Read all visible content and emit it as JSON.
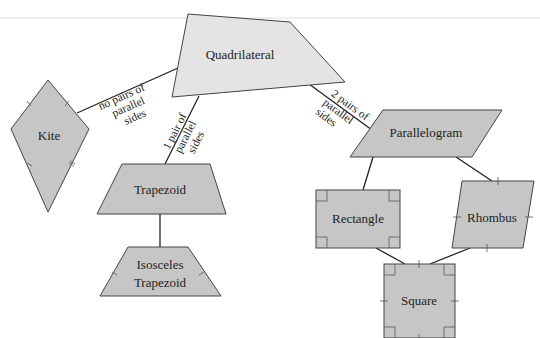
{
  "diagram": {
    "type": "hierarchy",
    "colors": {
      "light_fill": "#e4e4e4",
      "dark_fill": "#c6c6c6",
      "stroke": "#333333",
      "text": "#222222"
    },
    "nodes": {
      "quadrilateral": {
        "label": "Quadrilateral"
      },
      "kite": {
        "label": "Kite"
      },
      "trapezoid": {
        "label": "Trapezoid"
      },
      "isosceles_line1": {
        "label": "Isosceles"
      },
      "isosceles_line2": {
        "label": "Trapezoid"
      },
      "parallelogram": {
        "label": "Parallelogram"
      },
      "rectangle": {
        "label": "Rectangle"
      },
      "rhombus": {
        "label": "Rhombus"
      },
      "square": {
        "label": "Square"
      }
    },
    "edges": {
      "no_pairs": {
        "line1": "no pairs of",
        "line2": "parallel",
        "line3": "sides"
      },
      "one_pair": {
        "line1": "1 pair of",
        "line2": "parallel",
        "line3": "sides"
      },
      "two_pairs": {
        "line1": "2 pairs of",
        "line2": "parallel",
        "line3": "sides"
      }
    }
  }
}
